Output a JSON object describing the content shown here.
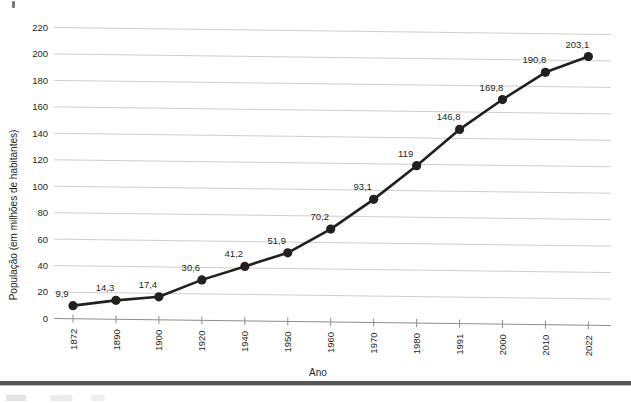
{
  "chart_data": {
    "type": "line",
    "title": "",
    "xlabel": "Ano",
    "ylabel": "População (em milhões de habitantes)",
    "categories": [
      "1872",
      "1890",
      "1900",
      "1920",
      "1940",
      "1950",
      "1960",
      "1970",
      "1980",
      "1991",
      "2000",
      "2010",
      "2022"
    ],
    "values": [
      9.9,
      14.3,
      17.4,
      30.6,
      41.2,
      51.9,
      70.2,
      93.1,
      119,
      146.8,
      169.8,
      190.8,
      203.1
    ],
    "point_labels": [
      "9,9",
      "14,3",
      "17,4",
      "30,6",
      "41,2",
      "51,9",
      "70,2",
      "93,1",
      "119",
      "146,8",
      "169,8",
      "190,8",
      "203,1"
    ],
    "ylim": [
      0,
      220
    ],
    "yticks": [
      0,
      20,
      40,
      60,
      80,
      100,
      120,
      140,
      160,
      180,
      200,
      220
    ],
    "ytick_labels": [
      "0",
      "20",
      "40",
      "60",
      "80",
      "100",
      "120",
      "140",
      "160",
      "180",
      "200",
      "220"
    ],
    "grid": true,
    "legend": false,
    "series_color": "#221f1f",
    "grid_color": "#c9c9c9",
    "marker": "circle"
  }
}
